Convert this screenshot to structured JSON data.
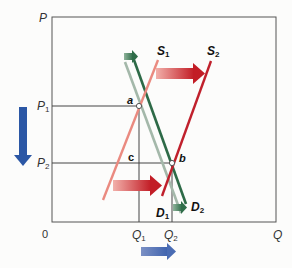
{
  "diagram": {
    "type": "supply-demand-shift",
    "axes": {
      "y_label": "P",
      "x_label": "Q",
      "origin_label": "0"
    },
    "price_ticks": [
      {
        "base": "P",
        "sub": "1"
      },
      {
        "base": "P",
        "sub": "2"
      }
    ],
    "quantity_ticks": [
      {
        "base": "Q",
        "sub": "1"
      },
      {
        "base": "Q",
        "sub": "2"
      }
    ],
    "curves": {
      "s1": {
        "base": "S",
        "sub": "1",
        "color": "#e8837a"
      },
      "s2": {
        "base": "S",
        "sub": "2",
        "color": "#c0202c"
      },
      "d1": {
        "base": "D",
        "sub": "1",
        "color": "#9fb3a6"
      },
      "d2": {
        "base": "D",
        "sub": "2",
        "color": "#2e6a48"
      }
    },
    "points": {
      "a": "a",
      "b": "b",
      "c": "c"
    },
    "arrows": {
      "supply_shift_color": "#c8202a",
      "demand_shift_color": "#4f8a66",
      "price_change_color": "#2b57a5",
      "quantity_change_color": "#5a78b8"
    }
  }
}
